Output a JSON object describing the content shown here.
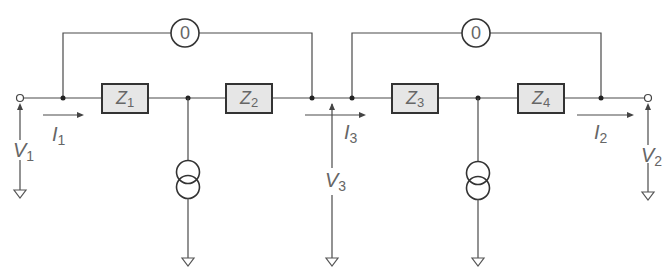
{
  "diagram": {
    "type": "circuit",
    "impedances": [
      {
        "id": "Z1",
        "symbol": "Z",
        "sub": "1"
      },
      {
        "id": "Z2",
        "symbol": "Z",
        "sub": "2"
      },
      {
        "id": "Z3",
        "symbol": "Z",
        "sub": "3"
      },
      {
        "id": "Z4",
        "symbol": "Z",
        "sub": "4"
      }
    ],
    "nullators": [
      {
        "id": "nullator-left",
        "label": "0"
      },
      {
        "id": "nullator-right",
        "label": "0"
      }
    ],
    "currents": [
      {
        "id": "I1",
        "symbol": "I",
        "sub": "1"
      },
      {
        "id": "I3",
        "symbol": "I",
        "sub": "3"
      },
      {
        "id": "I2",
        "symbol": "I",
        "sub": "2"
      }
    ],
    "voltages": [
      {
        "id": "V1",
        "symbol": "V",
        "sub": "1"
      },
      {
        "id": "V3",
        "symbol": "V",
        "sub": "3"
      },
      {
        "id": "V2",
        "symbol": "V",
        "sub": "2"
      }
    ],
    "sources": [
      {
        "id": "current-source-1",
        "kind": "norator/current source"
      },
      {
        "id": "current-source-2",
        "kind": "norator/current source"
      }
    ]
  }
}
